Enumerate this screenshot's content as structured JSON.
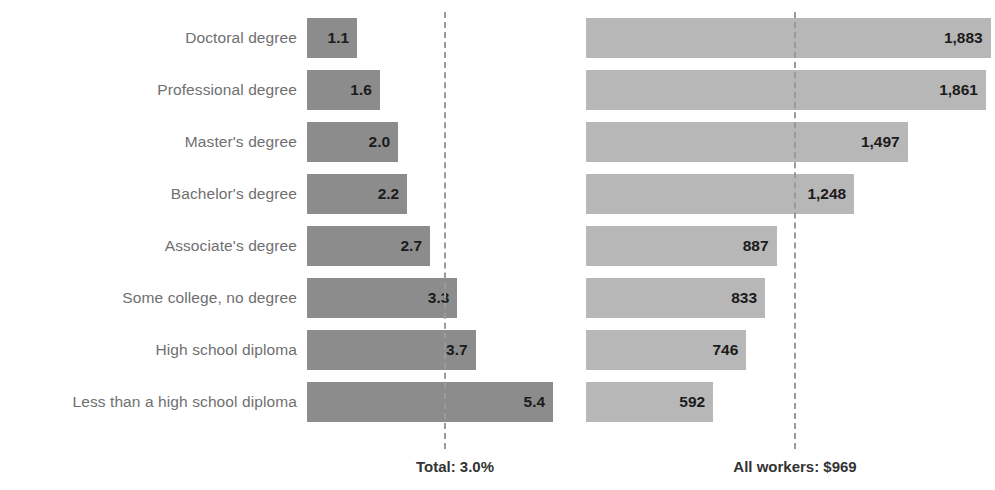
{
  "chart_data": {
    "type": "bar",
    "title": "",
    "subtitle": "",
    "xlabel": "",
    "ylabel": "",
    "grid": false,
    "legend": "none",
    "orientation": "horizontal",
    "categories": [
      "Doctoral degree",
      "Professional degree",
      "Master's degree",
      "Bachelor's degree",
      "Associate's degree",
      "Some college, no degree",
      "High school diploma",
      "Less than a high school diploma"
    ],
    "series": [
      {
        "name": "Unemployment rate",
        "panel": "left",
        "unit": "percent",
        "value_labels": [
          "1.1",
          "1.6",
          "2.0",
          "2.2",
          "2.7",
          "3.3",
          "3.7",
          "5.4"
        ],
        "values": [
          1.1,
          1.6,
          2.0,
          2.2,
          2.7,
          3.3,
          3.7,
          5.4
        ],
        "xlim": [
          0,
          6.1
        ],
        "color": "#8c8c8c",
        "reference_value": 3.0,
        "reference_label": "Total: 3.0%"
      },
      {
        "name": "Median usual weekly earnings",
        "panel": "right",
        "unit": "dollars",
        "value_labels": [
          "1,883",
          "1,861",
          "1,497",
          "1,248",
          "887",
          "833",
          "746",
          "592"
        ],
        "values": [
          1883,
          1861,
          1497,
          1248,
          887,
          833,
          746,
          592
        ],
        "xlim": [
          0,
          1903
        ],
        "color": "#b7b7b7",
        "reference_value": 969,
        "reference_label": "All workers: $969"
      }
    ]
  },
  "footers": {
    "left": "Total: 3.0%",
    "right": "All workers: $969"
  },
  "colors": {
    "bar_left": "#8c8c8c",
    "bar_right": "#b7b7b7",
    "label_text": "#6f6f6f",
    "value_text": "#1b1b1b",
    "reference_line": "#9a9a9a",
    "background": "#ffffff"
  }
}
